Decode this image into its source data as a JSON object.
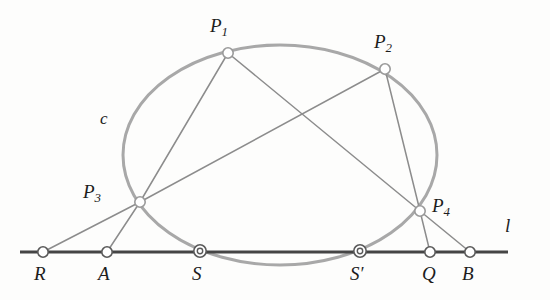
{
  "figure": {
    "colors": {
      "conic_stroke": "#a8a8a8",
      "chord_stroke": "#8c8c8c",
      "line_stroke": "#454545",
      "marker_stroke": "#8a8a8a",
      "marker_fill": "#ffffff",
      "label_color": "#1c1c1c",
      "background": "#fdfdfc"
    },
    "labels": {
      "conic": "c",
      "line": "l",
      "p1": "P",
      "p1_sub": "1",
      "p2": "P",
      "p2_sub": "2",
      "p3": "P",
      "p3_sub": "3",
      "p4": "P",
      "p4_sub": "4",
      "r": "R",
      "a": "A",
      "s": "S",
      "s_prime": "S",
      "s_prime_mark": "′",
      "q": "Q",
      "b": "B"
    },
    "conic": {
      "type": "ellipse",
      "center_x": 280,
      "center_y": 155,
      "radius_x": 157,
      "radius_y": 110,
      "stroke_width": 3
    },
    "line": {
      "name": "l",
      "x1": 20,
      "y1": 252,
      "x2": 508,
      "y2": 252,
      "stroke_width": 3.2
    },
    "points": [
      {
        "id": "P1",
        "x": 228,
        "y": 53,
        "marker": "circle",
        "r": 5.2,
        "on": "conic"
      },
      {
        "id": "P2",
        "x": 385,
        "y": 69,
        "marker": "circle",
        "r": 5.2,
        "on": "conic"
      },
      {
        "id": "P3",
        "x": 140,
        "y": 202,
        "marker": "circle",
        "r": 5.2,
        "on": "conic"
      },
      {
        "id": "P4",
        "x": 420,
        "y": 211,
        "marker": "circle",
        "r": 5.2,
        "on": "conic"
      },
      {
        "id": "R",
        "x": 43,
        "y": 252,
        "marker": "circle",
        "r": 5.2,
        "on": "line"
      },
      {
        "id": "A",
        "x": 107,
        "y": 252,
        "marker": "circle",
        "r": 5.2,
        "on": "line"
      },
      {
        "id": "S",
        "x": 200,
        "y": 251,
        "marker": "double-circle",
        "r": 6.0,
        "r_inner": 2.6,
        "on": "line-and-conic"
      },
      {
        "id": "Sp",
        "x": 360,
        "y": 251,
        "marker": "double-circle",
        "r": 6.0,
        "r_inner": 2.6,
        "on": "line-and-conic"
      },
      {
        "id": "Q",
        "x": 430,
        "y": 252,
        "marker": "circle",
        "r": 5.2,
        "on": "line"
      },
      {
        "id": "B",
        "x": 470,
        "y": 252,
        "marker": "circle",
        "r": 5.2,
        "on": "line"
      }
    ],
    "chords": [
      {
        "id": "P1-P3",
        "from": "P1",
        "to": "P3",
        "x1": 228,
        "y1": 53,
        "x2": 140,
        "y2": 202
      },
      {
        "id": "P1-P4",
        "from": "P1",
        "to": "P4",
        "x1": 228,
        "y1": 53,
        "x2": 420,
        "y2": 211
      },
      {
        "id": "P2-P3",
        "from": "P2",
        "to": "P3",
        "x1": 385,
        "y1": 69,
        "x2": 140,
        "y2": 202
      },
      {
        "id": "P2-P4",
        "from": "P2",
        "to": "P4",
        "x1": 385,
        "y1": 69,
        "x2": 420,
        "y2": 211
      },
      {
        "id": "P3-R",
        "from": "P3",
        "to": "R",
        "x1": 140,
        "y1": 202,
        "x2": 43,
        "y2": 252
      },
      {
        "id": "P3-A",
        "from": "P3",
        "to": "A",
        "x1": 140,
        "y1": 202,
        "x2": 107,
        "y2": 252
      },
      {
        "id": "P4-Q",
        "from": "P4",
        "to": "Q",
        "x1": 420,
        "y1": 211,
        "x2": 430,
        "y2": 252
      },
      {
        "id": "P4-B",
        "from": "P4",
        "to": "B",
        "x1": 420,
        "y1": 211,
        "x2": 470,
        "y2": 252
      }
    ],
    "label_positions": {
      "conic": {
        "x": 100,
        "y": 110
      },
      "line": {
        "x": 505,
        "y": 216
      },
      "p1": {
        "x": 210,
        "y": 16
      },
      "p2": {
        "x": 374,
        "y": 32
      },
      "p3": {
        "x": 83,
        "y": 182
      },
      "p4": {
        "x": 432,
        "y": 196
      },
      "r": {
        "x": 34,
        "y": 264
      },
      "a": {
        "x": 98,
        "y": 264
      },
      "s": {
        "x": 192,
        "y": 264
      },
      "sprime": {
        "x": 350,
        "y": 264
      },
      "q": {
        "x": 422,
        "y": 264
      },
      "b": {
        "x": 462,
        "y": 264
      }
    }
  }
}
